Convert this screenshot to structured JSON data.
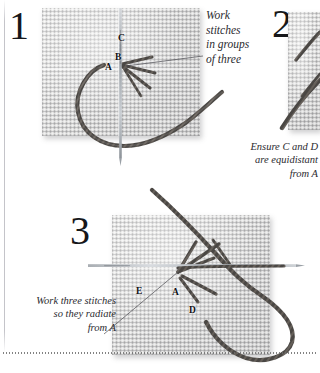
{
  "page": {
    "background": "#ffffff",
    "ink": "#16171a",
    "fabric_color": "#dcdcda",
    "fabric_grid_color": "#78787c",
    "thread_color": "#4a4744",
    "needle_color": "#b9bcc0",
    "rule_color": "#6d6d6d"
  },
  "steps": [
    {
      "id": "step-1",
      "number": "1",
      "caption": "Work\nstitches\nin groups\nof three",
      "caption_align": "left",
      "labels": [
        {
          "text": "A",
          "x": 105,
          "y": 68
        },
        {
          "text": "B",
          "x": 118,
          "y": 58
        },
        {
          "text": "C",
          "x": 120,
          "y": 38
        }
      ]
    },
    {
      "id": "step-2",
      "number": "2",
      "caption": "Ensure C and D\nare equidistant\nfrom A",
      "caption_align": "right",
      "labels": []
    },
    {
      "id": "step-3",
      "number": "3",
      "caption": "Work three stitches\nso they radiate\nfrom A",
      "caption_align": "right",
      "labels": [
        {
          "text": "E",
          "x": 136,
          "y": 292
        },
        {
          "text": "A",
          "x": 176,
          "y": 293
        },
        {
          "text": "D",
          "x": 190,
          "y": 311
        }
      ]
    }
  ],
  "icons": {
    "needle": "needle-icon",
    "thread": "thread-icon",
    "fabric": "canvas-fabric-swatch",
    "leader": "leader-line"
  }
}
